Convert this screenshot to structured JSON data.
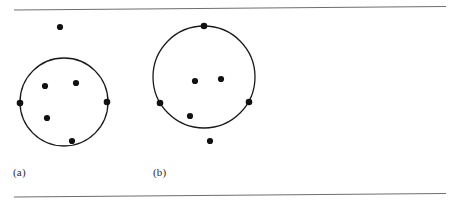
{
  "figure": {
    "width": 456,
    "height": 203,
    "background_color": "#ffffff",
    "ink_color": "#1a1a1a",
    "rule_color": "#6e6e6e",
    "point_color": "#111111",
    "rules": [
      {
        "name": "top-rule",
        "x1": 14,
        "y1": 10,
        "x2": 446,
        "y2": 6.5,
        "width": 1.1
      },
      {
        "name": "bottom-rule",
        "x1": 14,
        "y1": 197,
        "x2": 446,
        "y2": 193.5,
        "width": 1.1
      }
    ],
    "panels": [
      {
        "id": "a",
        "label": "(a)",
        "label_x": 13,
        "label_y": 166,
        "circle": {
          "cx": 64,
          "cy": 102,
          "r": 44,
          "stroke_width": 1.3
        },
        "points": [
          {
            "name": "point-a-outside-top",
            "x": 60,
            "y": 27,
            "r": 3.1,
            "position": "outside"
          },
          {
            "name": "point-a-boundary-left",
            "x": 20,
            "y": 103,
            "r": 3.3,
            "position": "boundary"
          },
          {
            "name": "point-a-boundary-right",
            "x": 107,
            "y": 102,
            "r": 3.3,
            "position": "boundary"
          },
          {
            "name": "point-a-interior-upper-left",
            "x": 45,
            "y": 86,
            "r": 3.1,
            "position": "interior"
          },
          {
            "name": "point-a-interior-upper-right",
            "x": 76,
            "y": 83,
            "r": 3.1,
            "position": "interior"
          },
          {
            "name": "point-a-interior-lower-left",
            "x": 47,
            "y": 118,
            "r": 3.1,
            "position": "interior"
          },
          {
            "name": "point-a-interior-bottom",
            "x": 72,
            "y": 141,
            "r": 3.1,
            "position": "interior"
          }
        ]
      },
      {
        "id": "b",
        "label": "(b)",
        "label_x": 153,
        "label_y": 166,
        "circle": {
          "cx": 204,
          "cy": 77,
          "r": 51,
          "stroke_width": 1.3
        },
        "points": [
          {
            "name": "point-b-boundary-top",
            "x": 204,
            "y": 26,
            "r": 3.3,
            "position": "boundary"
          },
          {
            "name": "point-b-boundary-left",
            "x": 160,
            "y": 103,
            "r": 3.3,
            "position": "boundary"
          },
          {
            "name": "point-b-boundary-right",
            "x": 249,
            "y": 102,
            "r": 3.3,
            "position": "boundary"
          },
          {
            "name": "point-b-interior-left",
            "x": 195,
            "y": 81,
            "r": 3.1,
            "position": "interior"
          },
          {
            "name": "point-b-interior-right",
            "x": 221,
            "y": 79,
            "r": 3.1,
            "position": "interior"
          },
          {
            "name": "point-b-interior-lower",
            "x": 190,
            "y": 116,
            "r": 3.1,
            "position": "interior"
          },
          {
            "name": "point-b-outside-bottom",
            "x": 210,
            "y": 141,
            "r": 3.1,
            "position": "outside"
          }
        ]
      }
    ]
  }
}
